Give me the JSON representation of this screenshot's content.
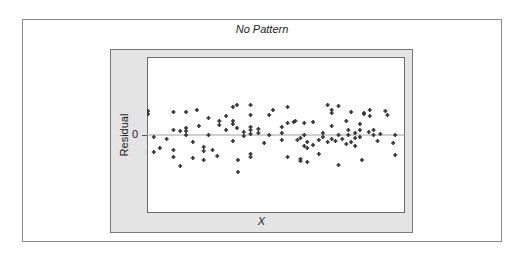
{
  "chart_data": {
    "type": "scatter",
    "title": "No Pattern",
    "xlabel": "X",
    "ylabel": "Residual",
    "y_ticks": [
      "0"
    ],
    "reference_line": {
      "y": 0,
      "color": "#a0a0a0"
    },
    "grid": false,
    "legend": null,
    "x_range": [
      0,
      100
    ],
    "y_range": [
      -7.8,
      7.8
    ],
    "marker_color": "#333333",
    "points": [
      {
        "x": 0.0,
        "y": 2.4
      },
      {
        "x": 0.0,
        "y": 2.1
      },
      {
        "x": 2.3,
        "y": -0.2
      },
      {
        "x": 2.3,
        "y": -1.7
      },
      {
        "x": 4.7,
        "y": -1.3
      },
      {
        "x": 7.4,
        "y": -0.4
      },
      {
        "x": 10.1,
        "y": 2.3
      },
      {
        "x": 10.1,
        "y": 0.5
      },
      {
        "x": 10.1,
        "y": -1.5
      },
      {
        "x": 10.1,
        "y": -2.2
      },
      {
        "x": 12.8,
        "y": 0.4
      },
      {
        "x": 12.8,
        "y": -3.1
      },
      {
        "x": 15.1,
        "y": 2.3
      },
      {
        "x": 15.1,
        "y": 0.7
      },
      {
        "x": 15.1,
        "y": 0.4
      },
      {
        "x": 15.1,
        "y": 0.0
      },
      {
        "x": 17.8,
        "y": -2.3
      },
      {
        "x": 17.8,
        "y": -0.7
      },
      {
        "x": 19.4,
        "y": 2.5
      },
      {
        "x": 20.2,
        "y": 0.9
      },
      {
        "x": 22.1,
        "y": -1.2
      },
      {
        "x": 22.1,
        "y": -1.6
      },
      {
        "x": 22.1,
        "y": -2.5
      },
      {
        "x": 24.0,
        "y": 1.7
      },
      {
        "x": 24.0,
        "y": 0.0
      },
      {
        "x": 25.6,
        "y": -1.5
      },
      {
        "x": 27.5,
        "y": -2.1
      },
      {
        "x": 28.3,
        "y": 1.0
      },
      {
        "x": 28.3,
        "y": 1.4
      },
      {
        "x": 31.0,
        "y": 1.9
      },
      {
        "x": 31.0,
        "y": 0.5
      },
      {
        "x": 33.7,
        "y": 2.8
      },
      {
        "x": 33.7,
        "y": 1.4
      },
      {
        "x": 33.7,
        "y": 1.1
      },
      {
        "x": 33.7,
        "y": -0.6
      },
      {
        "x": 35.3,
        "y": 3.0
      },
      {
        "x": 35.3,
        "y": 0.7
      },
      {
        "x": 35.7,
        "y": -2.5
      },
      {
        "x": 35.7,
        "y": -3.7
      },
      {
        "x": 38.0,
        "y": 0.3
      },
      {
        "x": 38.0,
        "y": -0.1
      },
      {
        "x": 40.7,
        "y": 3.0
      },
      {
        "x": 40.7,
        "y": 2.0
      },
      {
        "x": 40.7,
        "y": 0.8
      },
      {
        "x": 40.7,
        "y": 0.5
      },
      {
        "x": 40.7,
        "y": 0.1
      },
      {
        "x": 40.7,
        "y": -1.9
      },
      {
        "x": 40.7,
        "y": -2.2
      },
      {
        "x": 43.8,
        "y": 0.6
      },
      {
        "x": 43.8,
        "y": 0.2
      },
      {
        "x": 46.1,
        "y": -0.8
      },
      {
        "x": 48.1,
        "y": 2.0
      },
      {
        "x": 48.1,
        "y": 0.0
      },
      {
        "x": 49.6,
        "y": 2.5
      },
      {
        "x": 53.1,
        "y": 0.8
      },
      {
        "x": 53.1,
        "y": 0.2
      },
      {
        "x": 53.1,
        "y": -0.5
      },
      {
        "x": 55.4,
        "y": 2.8
      },
      {
        "x": 55.4,
        "y": 1.2
      },
      {
        "x": 55.4,
        "y": -2.2
      },
      {
        "x": 57.8,
        "y": 1.3
      },
      {
        "x": 58.5,
        "y": 1.4
      },
      {
        "x": 59.3,
        "y": -0.5
      },
      {
        "x": 60.5,
        "y": -0.3
      },
      {
        "x": 60.5,
        "y": -2.4
      },
      {
        "x": 60.5,
        "y": -2.6
      },
      {
        "x": 62.0,
        "y": 1.2
      },
      {
        "x": 62.0,
        "y": 0.0
      },
      {
        "x": 62.0,
        "y": -1.1
      },
      {
        "x": 63.2,
        "y": -0.7
      },
      {
        "x": 63.2,
        "y": -1.3
      },
      {
        "x": 63.2,
        "y": -2.7
      },
      {
        "x": 65.5,
        "y": 1.3
      },
      {
        "x": 65.5,
        "y": -1.0
      },
      {
        "x": 67.8,
        "y": -0.5
      },
      {
        "x": 67.8,
        "y": -1.9
      },
      {
        "x": 69.4,
        "y": 0.2
      },
      {
        "x": 69.4,
        "y": -0.2
      },
      {
        "x": 71.3,
        "y": 3.0
      },
      {
        "x": 71.3,
        "y": -0.7
      },
      {
        "x": 72.9,
        "y": 2.5
      },
      {
        "x": 72.9,
        "y": 2.2
      },
      {
        "x": 72.9,
        "y": 0.9
      },
      {
        "x": 72.9,
        "y": -0.4
      },
      {
        "x": 74.4,
        "y": -0.6
      },
      {
        "x": 75.6,
        "y": 2.9
      },
      {
        "x": 75.6,
        "y": 0.0
      },
      {
        "x": 75.6,
        "y": -3.0
      },
      {
        "x": 77.1,
        "y": -0.4
      },
      {
        "x": 78.7,
        "y": 1.4
      },
      {
        "x": 78.7,
        "y": -0.9
      },
      {
        "x": 79.5,
        "y": 0.5
      },
      {
        "x": 79.5,
        "y": 0.0
      },
      {
        "x": 80.6,
        "y": 2.3
      },
      {
        "x": 80.6,
        "y": -0.7
      },
      {
        "x": 82.2,
        "y": 0.2
      },
      {
        "x": 82.2,
        "y": -0.3
      },
      {
        "x": 82.2,
        "y": -1.1
      },
      {
        "x": 84.1,
        "y": 1.1
      },
      {
        "x": 84.1,
        "y": 0.5
      },
      {
        "x": 84.1,
        "y": -0.2
      },
      {
        "x": 84.9,
        "y": -2.5
      },
      {
        "x": 85.7,
        "y": 2.1
      },
      {
        "x": 85.7,
        "y": 2.2
      },
      {
        "x": 87.6,
        "y": 0.3
      },
      {
        "x": 88.0,
        "y": 2.5
      },
      {
        "x": 88.0,
        "y": 1.9
      },
      {
        "x": 89.5,
        "y": 0.5
      },
      {
        "x": 89.5,
        "y": 0.0
      },
      {
        "x": 91.1,
        "y": -0.6
      },
      {
        "x": 92.2,
        "y": 0.1
      },
      {
        "x": 94.2,
        "y": 2.4
      },
      {
        "x": 95.0,
        "y": 2.0
      },
      {
        "x": 97.3,
        "y": -0.8
      },
      {
        "x": 98.1,
        "y": 0.0
      },
      {
        "x": 98.1,
        "y": -2.0
      }
    ]
  }
}
